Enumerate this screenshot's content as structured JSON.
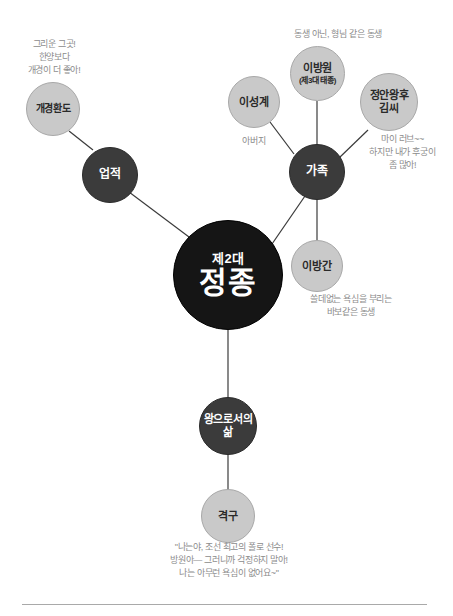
{
  "diagram": {
    "title": "제2대 정종",
    "center": {
      "ordinal": "제2대",
      "name": "정종"
    },
    "colors": {
      "center_fill": "#151515",
      "branch_fill": "#3b3b3b",
      "leaf_fill": "#c9c9c9",
      "edge": "#3b3b3b",
      "annotation_text": "#8c8c8c",
      "background": "#ffffff"
    },
    "branches": [
      {
        "id": "achievements",
        "label": "업적"
      },
      {
        "id": "family",
        "label": "가족"
      },
      {
        "id": "life-as-king",
        "label": "왕으로서의\n삶"
      }
    ],
    "leaves": [
      {
        "id": "gaegyeong-hwando",
        "label": "개경환도",
        "sub": ""
      },
      {
        "id": "yi-seong-gye",
        "label": "이성계",
        "sub": ""
      },
      {
        "id": "yi-bang-won",
        "label": "이방원",
        "sub": "(제3대 태종)"
      },
      {
        "id": "jeongan-queen-kim",
        "label": "정안왕후\n김씨",
        "sub": ""
      },
      {
        "id": "yi-bang-gan",
        "label": "이방간",
        "sub": ""
      },
      {
        "id": "gyeokgu",
        "label": "격구",
        "sub": ""
      }
    ],
    "annotations": [
      {
        "id": "gaegyeong-note",
        "text": "그리운 그곳!\n한양보다\n개경이 더 좋아!"
      },
      {
        "id": "yi-bang-won-note",
        "text": "동생 아닌, 형님 같은 동생"
      },
      {
        "id": "father-note",
        "text": "아버지"
      },
      {
        "id": "queen-note",
        "text": "마이 러브~~\n하지만 내가 후궁이\n좀 많아!"
      },
      {
        "id": "yi-bang-gan-note",
        "text": "쓸데없는 욕심을 부리는\n바보같은 동생"
      },
      {
        "id": "gyeokgu-quote",
        "text": "\"나는야, 조선 최고의 폴로 선수!\n방원아— 그러니까 걱정하지 말아!\n나는 아무런 욕심이 없어요~\""
      }
    ]
  }
}
